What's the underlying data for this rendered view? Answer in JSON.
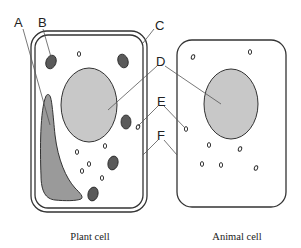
{
  "diagram": {
    "labels": {
      "A": "A",
      "B": "B",
      "C": "C",
      "D": "D",
      "E": "E",
      "F": "F"
    },
    "captions": {
      "plant": "Plant cell",
      "animal": "Animal cell"
    },
    "colors": {
      "nucleus_fill": "#c8c8c8",
      "vacuole_fill": "#9a9a9a",
      "chloroplast_fill": "#5a5a5a",
      "outline": "#333333",
      "leader_line": "#555555"
    }
  }
}
